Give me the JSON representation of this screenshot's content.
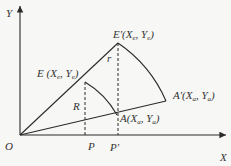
{
  "diagram": {
    "axes": {
      "x_label": "X",
      "y_label": "Y",
      "origin_label": "O"
    },
    "points": {
      "E": {
        "name": "E",
        "coord_x": "X",
        "coord_x_sub": "e",
        "coord_y": "Y",
        "coord_y_sub": "e"
      },
      "E_prime": {
        "name": "E'",
        "coord_x": "X",
        "coord_x_sub": "e",
        "coord_y": "Y",
        "coord_y_sub": "e"
      },
      "A": {
        "name": "A",
        "coord_x": "X",
        "coord_x_sub": "a",
        "coord_y": "Y",
        "coord_y_sub": "a"
      },
      "A_prime": {
        "name": "A'",
        "coord_x": "X",
        "coord_x_sub": "a",
        "coord_y": "Y",
        "coord_y_sub": "a"
      },
      "P": {
        "name": "P"
      },
      "P_prime": {
        "name": "P'"
      }
    },
    "segment_labels": {
      "R": "R",
      "r": "r"
    },
    "colors": {
      "line": "#2a2a2a",
      "background": "#f7f7f5"
    }
  }
}
